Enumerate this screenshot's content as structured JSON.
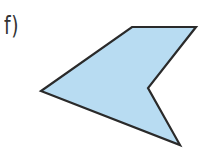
{
  "label": "f)",
  "shape": {
    "type": "concave-pentagon",
    "points": [
      [
        132,
        27
      ],
      [
        196,
        27
      ],
      [
        148,
        88
      ],
      [
        180,
        145
      ],
      [
        41,
        91
      ]
    ],
    "fill": "#b8dcf2",
    "stroke": "#2a2a2a",
    "stroke_width": 2.2
  }
}
